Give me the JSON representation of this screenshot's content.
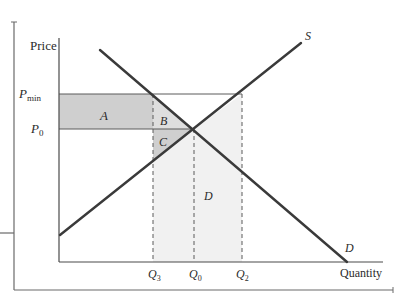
{
  "diagram": {
    "type": "supply-demand-price-floor",
    "axes": {
      "y_label": "Price",
      "x_label": "Quantity"
    },
    "price_labels": {
      "p_min": {
        "main": "P",
        "sub": "min"
      },
      "p_0": {
        "main": "P",
        "sub": "0"
      }
    },
    "quantity_labels": {
      "q3": {
        "main": "Q",
        "sub": "3"
      },
      "q0": {
        "main": "Q",
        "sub": "0"
      },
      "q2": {
        "main": "Q",
        "sub": "2"
      }
    },
    "curves": {
      "supply_label": "S",
      "demand_label": "D"
    },
    "regions": {
      "a": "A",
      "b": "B",
      "c": "C",
      "d": "D"
    },
    "colors": {
      "line": "#3a3a3a",
      "region_a": "#cfcfcf",
      "region_b": "#dedede",
      "region_c": "#cfcfcf",
      "region_d": "#f1f1f1",
      "frame": "#6a6a6a"
    }
  }
}
